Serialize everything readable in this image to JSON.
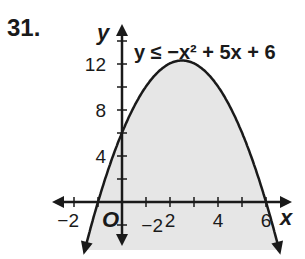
{
  "problem": {
    "number": "31."
  },
  "chart_data": {
    "type": "line",
    "title": "",
    "inequality_label": "y ≤ −x² + 5x + 6",
    "function": "y = -x^2 + 5x + 6",
    "inequality": "<=",
    "shaded_region": "below curve",
    "boundary_style": "solid",
    "x": [
      -1.5,
      -1,
      0,
      1,
      2,
      2.5,
      3,
      4,
      5,
      6,
      6.5
    ],
    "y": [
      -3.75,
      0,
      6,
      10,
      12,
      12.25,
      12,
      10,
      6,
      0,
      -3.75
    ],
    "vertex": [
      2.5,
      12.25
    ],
    "x_intercepts": [
      -1,
      6
    ],
    "y_intercept": 6,
    "xlabel": "x",
    "ylabel": "y",
    "origin_label": "O",
    "x_ticks": [
      -2,
      2,
      4,
      6
    ],
    "x_tick_labels": [
      "−2",
      "2",
      "4",
      "6"
    ],
    "y_ticks": [
      -2,
      4,
      8,
      12
    ],
    "y_tick_labels": [
      "−2",
      "4",
      "8",
      "12"
    ],
    "xlim": [
      -2.5,
      7
    ],
    "ylim": [
      -4,
      14
    ],
    "grid": false,
    "legend": "none",
    "colors": {
      "curve": "#1a1a1a",
      "shade": "#e6e6e6",
      "axis": "#1a1a1a"
    }
  }
}
